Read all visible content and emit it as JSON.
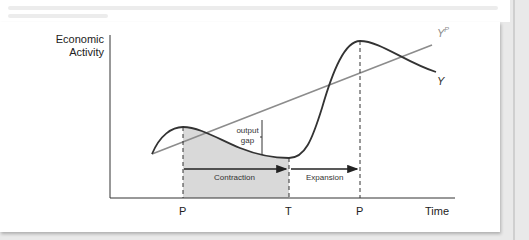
{
  "figure": {
    "y_axis_label_line1": "Economic",
    "y_axis_label_line2": "Activity",
    "x_axis_label": "Time",
    "x_ticks": [
      "P",
      "T",
      "P"
    ],
    "curves": {
      "actual": "Y",
      "potential": "Y",
      "potential_superscript": "P"
    },
    "annotations": {
      "output_gap_line1": "output",
      "output_gap_line2": "gap",
      "contraction": "Contraction",
      "expansion": "Expansion"
    },
    "colors": {
      "actual_curve": "#333333",
      "potential_line": "#8c8c8c",
      "shaded_region": "#d9d9d9",
      "axes": "#333333"
    }
  }
}
